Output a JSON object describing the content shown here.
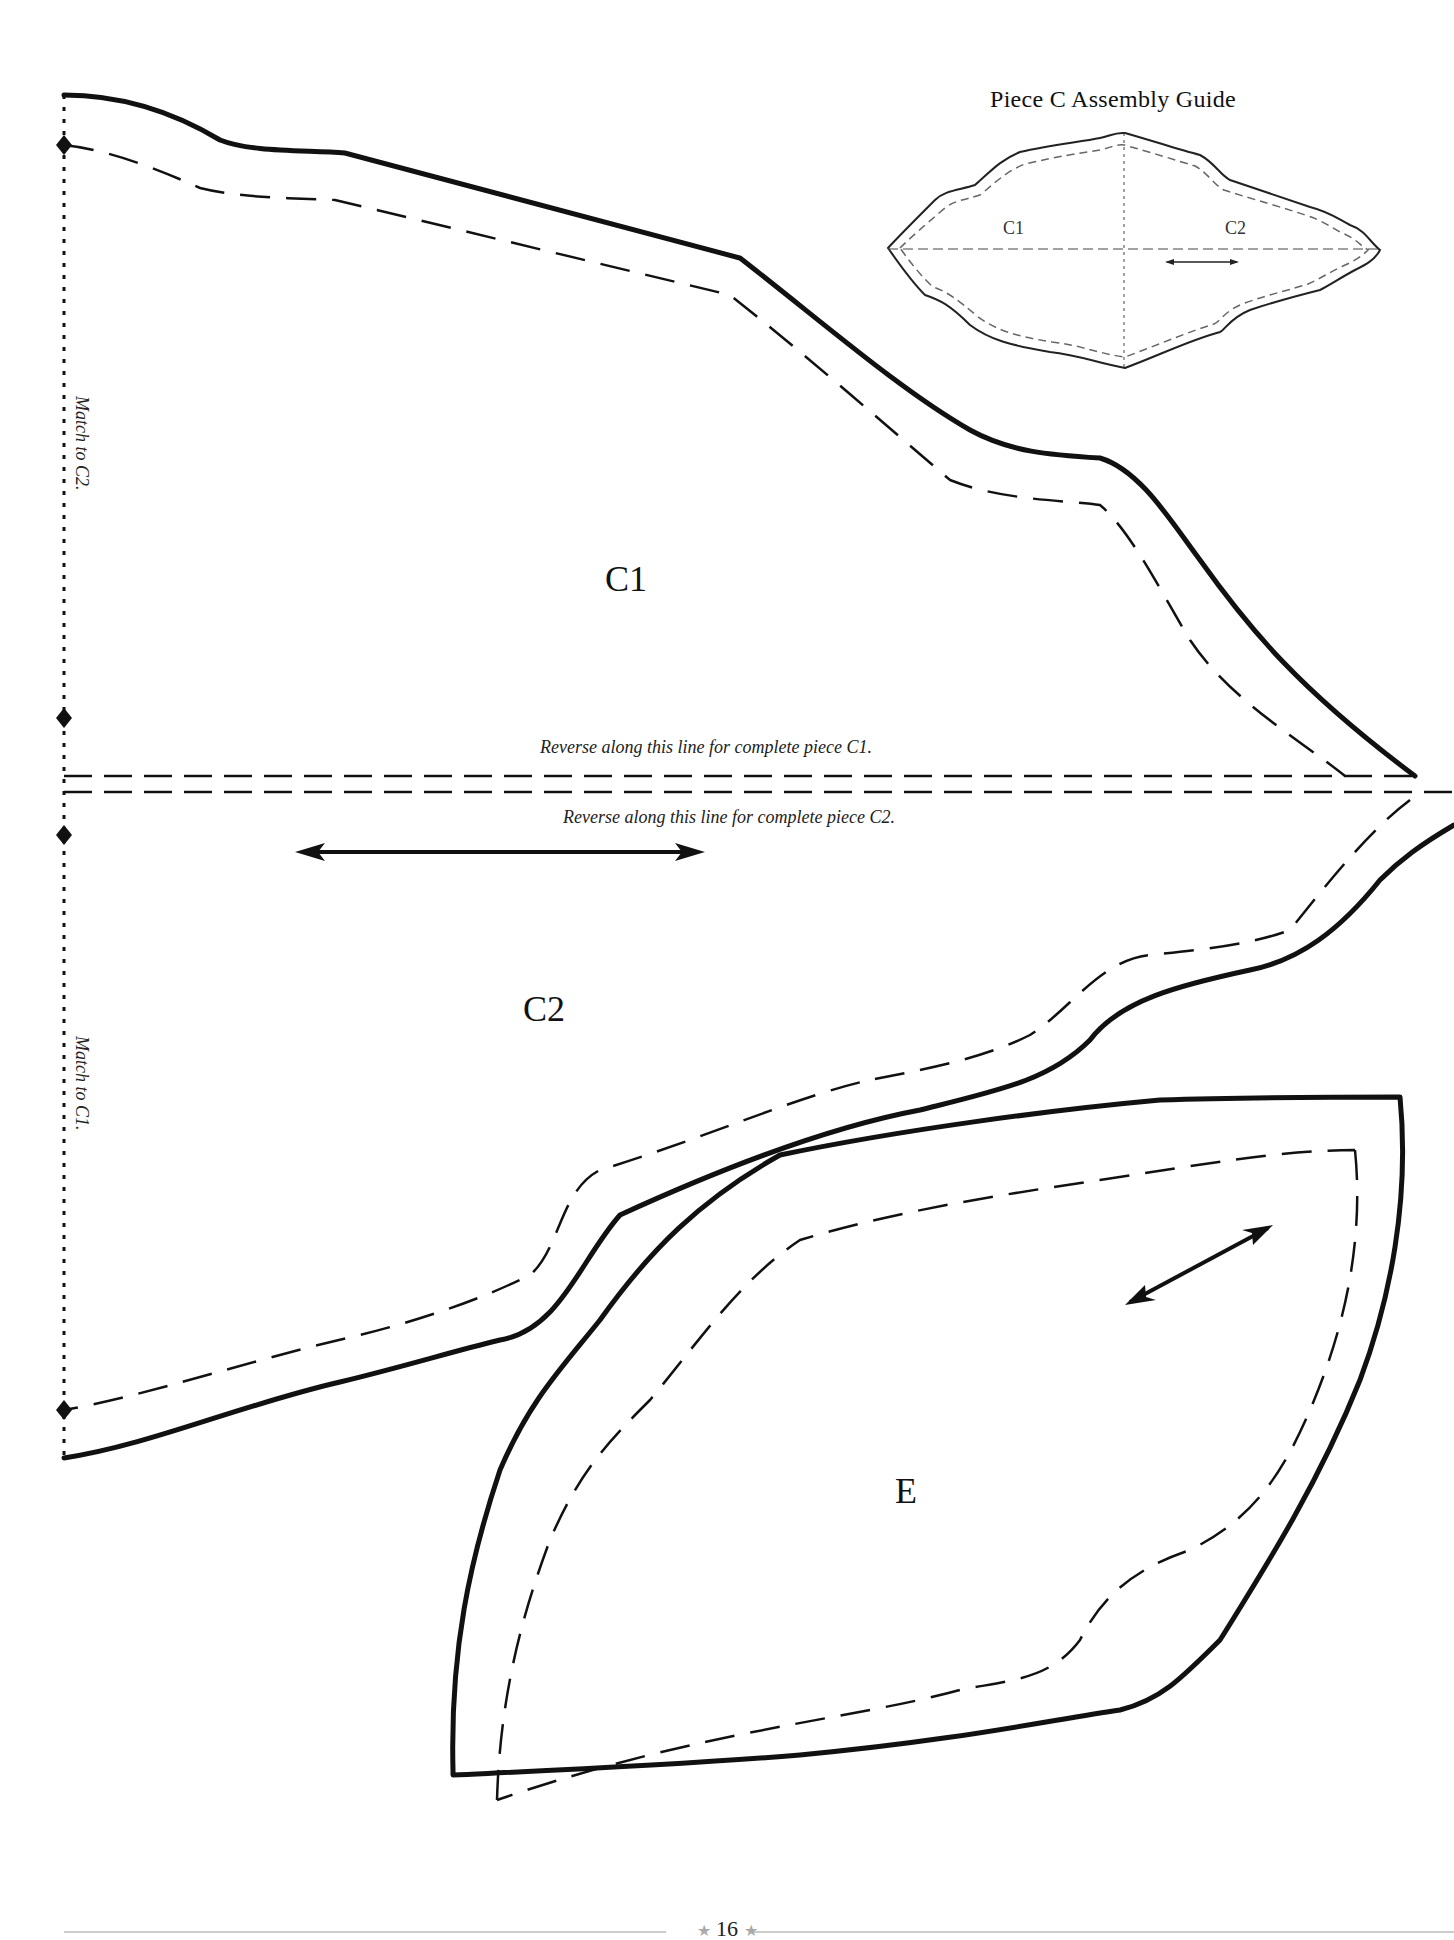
{
  "page": {
    "type": "sewing pattern page",
    "page_number": "16",
    "page_number_ornament": "★"
  },
  "assembly_guide": {
    "title": "Piece C Assembly Guide",
    "labels": [
      "C1",
      "C2"
    ]
  },
  "pieces": {
    "c1": {
      "label": "C1",
      "reverse_note": "Reverse along this line for complete piece C1.",
      "match_note": "Match to C2."
    },
    "c2": {
      "label": "C2",
      "reverse_note": "Reverse along this line for complete piece C2.",
      "match_note": "Match to C1."
    },
    "e": {
      "label": "E"
    }
  },
  "legend": {
    "cut_line": "solid",
    "seam_line": "dashed",
    "fold_line": "dotted",
    "grainline": "double-arrow",
    "match_marker": "diamond"
  },
  "colors": {
    "ink": "#111111",
    "guide_ink": "#333333",
    "ornament": "#aaaaaa",
    "paper": "#ffffff"
  }
}
